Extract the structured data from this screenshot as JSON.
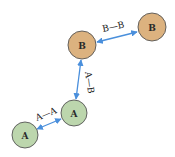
{
  "nodes": [
    {
      "id": "a1",
      "label": "A",
      "type": "A",
      "cx": 25,
      "cy": 135,
      "r": 13
    },
    {
      "id": "a2",
      "label": "A",
      "type": "A",
      "cx": 74,
      "cy": 113,
      "r": 13
    },
    {
      "id": "b1",
      "label": "B",
      "type": "B",
      "cx": 82,
      "cy": 45,
      "r": 14
    },
    {
      "id": "b2",
      "label": "B",
      "type": "B",
      "cx": 152,
      "cy": 27,
      "r": 14
    }
  ],
  "edges": [
    {
      "id": "e1",
      "label": "A—A",
      "from": "a1",
      "to": "a2"
    },
    {
      "id": "e2",
      "label": "A—B",
      "from": "a2",
      "to": "b1"
    },
    {
      "id": "e3",
      "label": "B—B",
      "from": "b1",
      "to": "b2"
    }
  ],
  "colors": {
    "A_fill": "#bcd6ad",
    "B_fill": "#dcb27f",
    "stroke": "#555555",
    "edge": "#4a8fdc"
  }
}
